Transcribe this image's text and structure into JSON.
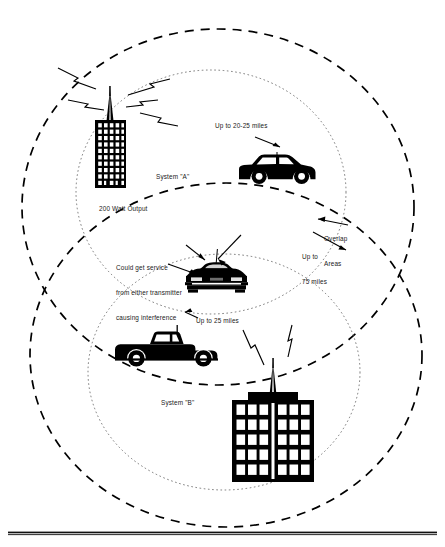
{
  "figure": {
    "type": "diagram",
    "background_color": "#ffffff",
    "ink_color": "#000000"
  },
  "labels": {
    "system_a": "System \"A\"",
    "system_a_power": "200 Watt Output",
    "range_a": "Up to 20-25 miles",
    "interference_line1": "Could get service",
    "interference_line2": "from either transmitter",
    "interference_line3": "causing interference",
    "overlap_line1": "Overlap",
    "overlap_line2": "Areas",
    "overlap_range_line1": "Up to",
    "overlap_range_line2": "75 miles",
    "range_b": "Up to 25 miles",
    "system_b": "System \"B\""
  },
  "caption": {
    "text": ""
  },
  "icons": {
    "tower_a": "transmitter-tower-icon",
    "tower_b": "transmitter-tower-icon",
    "building_a": "office-building-icon",
    "building_b": "office-building-icon",
    "vehicle_suv": "suv-icon",
    "vehicle_car": "car-front-icon",
    "vehicle_truck": "pickup-truck-icon",
    "signal": "lightning-bolt-icon",
    "pointer": "arrow-icon"
  },
  "geometry": {
    "system_a_outer_ellipse": {
      "cx": 218,
      "cy": 207,
      "rx": 196,
      "ry": 178,
      "style": "dashed-bold"
    },
    "system_a_inner_ellipse": {
      "cx": 211,
      "cy": 192,
      "rx": 135,
      "ry": 122,
      "style": "dotted-fine"
    },
    "system_b_outer_ellipse": {
      "cx": 226,
      "cy": 355,
      "rx": 196,
      "ry": 172,
      "style": "dashed-bold"
    },
    "system_b_inner_ellipse": {
      "cx": 224,
      "cy": 372,
      "rx": 136,
      "ry": 118,
      "style": "dotted-fine"
    },
    "baseline_rule": {
      "x1": 8,
      "y1": 533,
      "x2": 437,
      "y2": 533
    }
  }
}
